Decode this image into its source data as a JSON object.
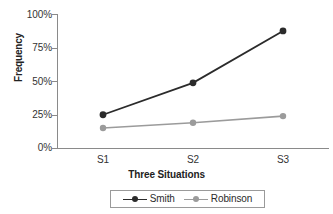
{
  "chart_data": {
    "type": "line",
    "title": "",
    "xlabel": "Three Situations",
    "ylabel": "Frequency",
    "categories": [
      "S1",
      "S2",
      "S3"
    ],
    "yticks": [
      "0%",
      "25%",
      "50%",
      "75%",
      "100%"
    ],
    "ylim": [
      0,
      100
    ],
    "grid": false,
    "legend_position": "bottom",
    "series": [
      {
        "name": "Smith",
        "values": [
          25,
          49,
          88
        ],
        "color": "#2b2b2b",
        "marker": "circle"
      },
      {
        "name": "Robinson",
        "values": [
          15,
          19,
          24
        ],
        "color": "#9b9b9b",
        "marker": "circle"
      }
    ]
  },
  "axis": {
    "y_title": "Frequency",
    "x_title": "Three Situations",
    "y_tick_100": "100%",
    "y_tick_75": "75%",
    "y_tick_50": "50%",
    "y_tick_25": "25%",
    "y_tick_0": "0%",
    "x_tick_1": "S1",
    "x_tick_2": "S2",
    "x_tick_3": "S3"
  },
  "legend": {
    "items": [
      {
        "label": "Smith"
      },
      {
        "label": "Robinson"
      }
    ]
  }
}
